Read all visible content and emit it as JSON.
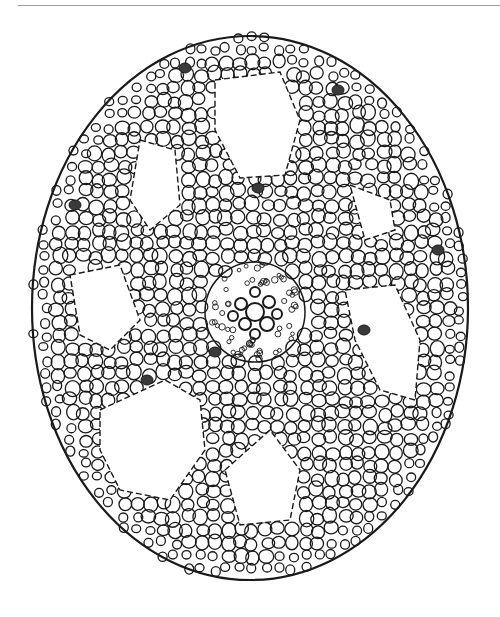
{
  "figure": {
    "colors": {
      "ink": "#1a1a1a",
      "paper": "#ffffff",
      "rule": "#9a9a9a",
      "dark_cell": "#3a3a3a"
    },
    "outline": {
      "cx": 250,
      "cy": 308,
      "rx": 218,
      "ry": 272
    },
    "stele": {
      "cx": 255,
      "cy": 312,
      "r": 50
    },
    "air_spaces": [
      [
        [
          215,
          80
        ],
        [
          280,
          72
        ],
        [
          300,
          120
        ],
        [
          285,
          175
        ],
        [
          240,
          178
        ],
        [
          215,
          130
        ]
      ],
      [
        [
          140,
          140
        ],
        [
          175,
          150
        ],
        [
          180,
          205
        ],
        [
          150,
          230
        ],
        [
          130,
          200
        ]
      ],
      [
        [
          70,
          275
        ],
        [
          120,
          265
        ],
        [
          140,
          320
        ],
        [
          110,
          350
        ],
        [
          80,
          335
        ]
      ],
      [
        [
          100,
          410
        ],
        [
          165,
          380
        ],
        [
          200,
          400
        ],
        [
          205,
          450
        ],
        [
          170,
          500
        ],
        [
          120,
          490
        ],
        [
          100,
          450
        ]
      ],
      [
        [
          225,
          470
        ],
        [
          270,
          430
        ],
        [
          300,
          470
        ],
        [
          290,
          520
        ],
        [
          240,
          525
        ]
      ],
      [
        [
          345,
          290
        ],
        [
          395,
          285
        ],
        [
          420,
          340
        ],
        [
          415,
          400
        ],
        [
          380,
          390
        ],
        [
          355,
          340
        ]
      ],
      [
        [
          350,
          185
        ],
        [
          390,
          200
        ],
        [
          395,
          230
        ],
        [
          365,
          240
        ]
      ]
    ],
    "dark_cells": [
      [
        147,
        380
      ],
      [
        258,
        188
      ],
      [
        438,
        250
      ],
      [
        338,
        90
      ],
      [
        185,
        68
      ],
      [
        75,
        205
      ],
      [
        364,
        330
      ],
      [
        215,
        352
      ]
    ]
  }
}
